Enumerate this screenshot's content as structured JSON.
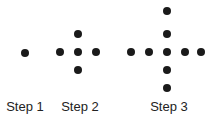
{
  "figure": {
    "dot_color": "#1a1a1a",
    "dot_radius": 4,
    "steps": [
      {
        "label": "Step 1",
        "label_x": 25,
        "dots": [
          [
            25,
            53
          ]
        ]
      },
      {
        "label": "Step 2",
        "label_x": 80,
        "dots": [
          [
            78,
            34
          ],
          [
            60,
            52
          ],
          [
            78,
            52
          ],
          [
            96,
            52
          ],
          [
            78,
            70
          ]
        ]
      },
      {
        "label": "Step 3",
        "label_x": 169,
        "dots": [
          [
            167,
            11
          ],
          [
            167,
            34
          ],
          [
            131,
            52
          ],
          [
            149,
            52
          ],
          [
            167,
            52
          ],
          [
            185,
            52
          ],
          [
            201,
            52
          ],
          [
            167,
            70
          ],
          [
            167,
            88
          ]
        ]
      }
    ]
  }
}
